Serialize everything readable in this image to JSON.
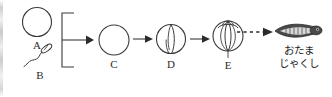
{
  "figure": {
    "ink_color": "#2b2b2b",
    "background_color": "#ffffff",
    "stages": [
      {
        "id": "A",
        "label": "A",
        "icon": "egg-cell-circle",
        "description": "plain circle representing an egg cell"
      },
      {
        "id": "B",
        "label": "B",
        "icon": "sperm-cell",
        "description": "small elongated head with wavy tail representing a sperm cell"
      },
      {
        "id": "C",
        "label": "C",
        "icon": "fertilized-egg-circle",
        "description": "plain circle representing a fertilized egg"
      },
      {
        "id": "D",
        "label": "D",
        "icon": "two-cell-stage",
        "description": "circle with a vertical cleavage furrow"
      },
      {
        "id": "E",
        "label": "E",
        "icon": "multi-cell-stage",
        "description": "sphere with several cleavage furrows and a polar cap"
      }
    ],
    "result": {
      "icon": "tadpole",
      "label_lines": [
        "おたま",
        "じゃくし"
      ]
    },
    "connectors": [
      {
        "id": "bracket",
        "kind": "brace",
        "from": [
          "A",
          "B"
        ],
        "to": "C"
      },
      {
        "id": "arrow-c-d",
        "kind": "solid-arrow",
        "from": "C",
        "to": "D"
      },
      {
        "id": "arrow-d-e",
        "kind": "solid-arrow",
        "from": "D",
        "to": "E"
      },
      {
        "id": "arrow-e-tadpole",
        "kind": "dashed-arrow",
        "from": "E",
        "to": "tadpole"
      }
    ]
  }
}
